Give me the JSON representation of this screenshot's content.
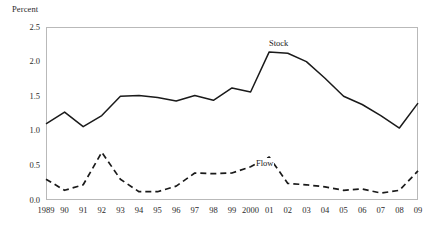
{
  "chart_data": {
    "type": "line",
    "title": "",
    "xlabel": "",
    "ylabel": "Percent",
    "ylim": [
      0.0,
      2.5
    ],
    "yticks": [
      "0.0",
      "0.5",
      "1.0",
      "1.5",
      "2.0",
      "2.5"
    ],
    "ytick_values": [
      0.0,
      0.5,
      1.0,
      1.5,
      2.0,
      2.5
    ],
    "grid": false,
    "legend_position": "inline-annotation",
    "categories": [
      "1989",
      "90",
      "91",
      "92",
      "93",
      "94",
      "95",
      "96",
      "97",
      "98",
      "99",
      "2000",
      "01",
      "02",
      "03",
      "04",
      "05",
      "06",
      "07",
      "08",
      "09"
    ],
    "x_values": [
      1989,
      1990,
      1991,
      1992,
      1993,
      1994,
      1995,
      1996,
      1997,
      1998,
      1999,
      2000,
      2001,
      2002,
      2003,
      2004,
      2005,
      2006,
      2007,
      2008,
      2009
    ],
    "series": [
      {
        "name": "Stock",
        "style": "solid",
        "color": "#1a1a1a",
        "values": [
          1.1,
          1.27,
          1.06,
          1.22,
          1.5,
          1.51,
          1.48,
          1.43,
          1.51,
          1.44,
          1.62,
          1.56,
          2.14,
          2.12,
          2.0,
          1.76,
          1.5,
          1.38,
          1.22,
          1.04,
          1.4
        ]
      },
      {
        "name": "Flow",
        "style": "dashed",
        "color": "#1a1a1a",
        "values": [
          0.3,
          0.14,
          0.22,
          0.69,
          0.3,
          0.12,
          0.12,
          0.2,
          0.39,
          0.38,
          0.39,
          0.48,
          0.62,
          0.24,
          0.22,
          0.19,
          0.14,
          0.16,
          0.1,
          0.14,
          0.42
        ]
      }
    ],
    "annotations": [
      {
        "text": "Stock",
        "x": 2000,
        "y": 2.3
      },
      {
        "text": "Flow",
        "x": 2000,
        "y": 0.6
      }
    ]
  }
}
